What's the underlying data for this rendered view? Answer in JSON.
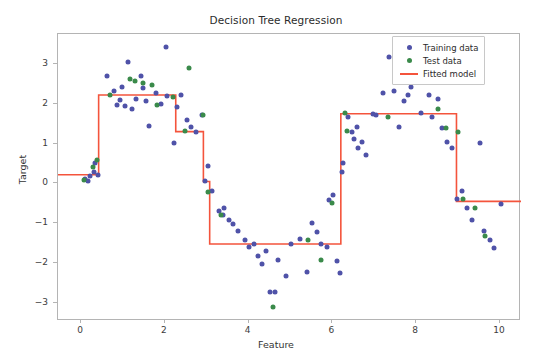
{
  "chart_data": {
    "type": "scatter",
    "title": "Decision Tree Regression",
    "xlabel": "Feature",
    "ylabel": "Target",
    "xlim": [
      -0.55,
      10.5
    ],
    "ylim": [
      -3.45,
      3.75
    ],
    "xticks": [
      0,
      2,
      4,
      6,
      8,
      10
    ],
    "yticks": [
      -3,
      -2,
      -1,
      0,
      1,
      2,
      3
    ],
    "xtick_labels": [
      "0",
      "2",
      "4",
      "6",
      "8",
      "10"
    ],
    "ytick_labels": [
      "-3",
      "-2",
      "-1",
      "0",
      "1",
      "2",
      "3"
    ],
    "grid": false,
    "legend_position": "upper right",
    "legend": [
      {
        "label": "Training data",
        "marker": "dot",
        "color": "#4f52a8"
      },
      {
        "label": "Test data",
        "marker": "dot",
        "color": "#3a8a4a"
      },
      {
        "label": "Fitted model",
        "marker": "line",
        "color": "#f4543c"
      }
    ],
    "series": [
      {
        "name": "Training data",
        "type": "scatter",
        "color": "#4f52a8",
        "points": [
          [
            0.1,
            0.1
          ],
          [
            0.16,
            0.05
          ],
          [
            0.22,
            0.18
          ],
          [
            0.3,
            0.3
          ],
          [
            0.34,
            0.52
          ],
          [
            0.4,
            0.22
          ],
          [
            0.62,
            2.7
          ],
          [
            0.78,
            2.32
          ],
          [
            0.86,
            1.98
          ],
          [
            0.92,
            2.1
          ],
          [
            0.98,
            2.42
          ],
          [
            1.05,
            1.95
          ],
          [
            1.12,
            3.05
          ],
          [
            1.22,
            1.88
          ],
          [
            1.3,
            2.12
          ],
          [
            1.42,
            2.7
          ],
          [
            1.48,
            2.4
          ],
          [
            1.55,
            2.08
          ],
          [
            1.62,
            1.45
          ],
          [
            1.78,
            2.28
          ],
          [
            1.9,
            2.0
          ],
          [
            2.02,
            3.42
          ],
          [
            2.06,
            2.2
          ],
          [
            2.22,
            1.02
          ],
          [
            2.3,
            1.92
          ],
          [
            2.38,
            2.22
          ],
          [
            2.52,
            1.58
          ],
          [
            2.62,
            1.42
          ],
          [
            2.74,
            1.3
          ],
          [
            2.88,
            1.72
          ],
          [
            2.96,
            0.05
          ],
          [
            3.02,
            0.45
          ],
          [
            3.12,
            -0.18
          ],
          [
            3.3,
            -0.7
          ],
          [
            3.38,
            -0.78
          ],
          [
            3.42,
            -0.62
          ],
          [
            3.52,
            -0.92
          ],
          [
            3.62,
            -1.02
          ],
          [
            3.74,
            -1.18
          ],
          [
            3.92,
            -1.42
          ],
          [
            4.02,
            -1.6
          ],
          [
            4.12,
            -1.52
          ],
          [
            4.22,
            -1.82
          ],
          [
            4.32,
            -2.02
          ],
          [
            4.42,
            -1.7
          ],
          [
            4.5,
            -2.72
          ],
          [
            4.62,
            -2.72
          ],
          [
            4.7,
            -1.92
          ],
          [
            4.9,
            -2.32
          ],
          [
            5.02,
            -1.52
          ],
          [
            5.22,
            -1.4
          ],
          [
            5.4,
            -2.22
          ],
          [
            5.52,
            -1.0
          ],
          [
            5.62,
            -1.22
          ],
          [
            5.72,
            -1.52
          ],
          [
            5.86,
            -1.6
          ],
          [
            5.92,
            -0.42
          ],
          [
            6.02,
            -0.28
          ],
          [
            6.1,
            -1.95
          ],
          [
            6.18,
            -2.25
          ],
          [
            6.22,
            0.28
          ],
          [
            6.26,
            0.52
          ],
          [
            6.38,
            1.68
          ],
          [
            6.46,
            1.28
          ],
          [
            6.52,
            1.12
          ],
          [
            6.58,
            1.42
          ],
          [
            6.62,
            0.88
          ],
          [
            6.7,
            1.05
          ],
          [
            6.8,
            0.72
          ],
          [
            6.96,
            1.75
          ],
          [
            7.04,
            1.72
          ],
          [
            7.2,
            2.28
          ],
          [
            7.36,
            3.18
          ],
          [
            7.48,
            2.32
          ],
          [
            7.58,
            1.42
          ],
          [
            7.7,
            2.08
          ],
          [
            7.8,
            2.22
          ],
          [
            7.88,
            2.42
          ],
          [
            7.96,
            2.95
          ],
          [
            8.04,
            2.62
          ],
          [
            8.12,
            1.78
          ],
          [
            8.3,
            2.22
          ],
          [
            8.38,
            1.68
          ],
          [
            8.52,
            2.12
          ],
          [
            8.62,
            1.38
          ],
          [
            8.74,
            1.05
          ],
          [
            8.86,
            0.9
          ],
          [
            8.98,
            -0.4
          ],
          [
            9.1,
            -0.18
          ],
          [
            9.22,
            -0.62
          ],
          [
            9.34,
            -0.92
          ],
          [
            9.52,
            1.02
          ],
          [
            9.62,
            -1.2
          ],
          [
            9.76,
            -1.42
          ],
          [
            9.86,
            -1.62
          ],
          [
            10.02,
            -0.52
          ]
        ]
      },
      {
        "name": "Test data",
        "type": "scatter",
        "color": "#3a8a4a",
        "points": [
          [
            0.06,
            0.08
          ],
          [
            0.28,
            0.42
          ],
          [
            0.38,
            0.58
          ],
          [
            0.68,
            2.22
          ],
          [
            1.18,
            2.62
          ],
          [
            1.28,
            2.58
          ],
          [
            1.48,
            2.52
          ],
          [
            1.7,
            2.48
          ],
          [
            1.82,
            1.98
          ],
          [
            2.2,
            2.18
          ],
          [
            2.48,
            1.32
          ],
          [
            2.58,
            2.9
          ],
          [
            2.9,
            1.72
          ],
          [
            3.02,
            -0.22
          ],
          [
            3.34,
            -0.78
          ],
          [
            4.58,
            -3.1
          ],
          [
            5.42,
            -1.42
          ],
          [
            5.72,
            -1.92
          ],
          [
            5.98,
            -0.48
          ],
          [
            6.3,
            1.78
          ],
          [
            6.34,
            1.32
          ],
          [
            7.32,
            1.68
          ],
          [
            8.52,
            1.88
          ],
          [
            8.7,
            1.38
          ],
          [
            9.0,
            1.3
          ],
          [
            9.12,
            -0.4
          ],
          [
            9.4,
            -0.62
          ],
          [
            9.64,
            -1.32
          ]
        ]
      },
      {
        "name": "Fitted model",
        "type": "step",
        "color": "#f4543c",
        "step_edges": [
          -0.55,
          0.42,
          2.26,
          2.92,
          3.07,
          6.2,
          8.96,
          10.5
        ],
        "step_values": [
          0.22,
          2.22,
          1.3,
          0.05,
          -1.52,
          1.75,
          -0.45
        ]
      }
    ]
  }
}
